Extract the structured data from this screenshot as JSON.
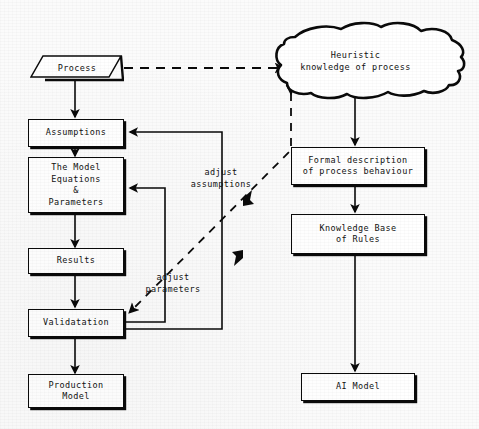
{
  "diagram": {
    "accent_color": "#0a0a0a",
    "background_color": "#fbfbfb",
    "nodes": {
      "process": {
        "label": "Process",
        "shape": "parallelogram"
      },
      "assumptions": {
        "label": "Assumptions",
        "shape": "rectangle"
      },
      "model_equations": {
        "label": "The Model\nEquations\n&\nParameters",
        "shape": "rectangle"
      },
      "results": {
        "label": "Results",
        "shape": "rectangle"
      },
      "validatation": {
        "label": "Validatation",
        "shape": "rectangle"
      },
      "production_model": {
        "label": "Production\nModel",
        "shape": "rectangle"
      },
      "heuristic_knowledge": {
        "label": "Heuristic\nknowledge of process",
        "shape": "cloud"
      },
      "formal_description": {
        "label": "Formal description\nof process behaviour",
        "shape": "rectangle"
      },
      "knowledge_base": {
        "label": "Knowledge Base\nof Rules",
        "shape": "rectangle"
      },
      "ai_model": {
        "label": "AI Model",
        "shape": "rectangle"
      }
    },
    "edge_labels": {
      "adjust_assumptions": "adjust\nassumptions",
      "adjust_parameters": "adjust\nparameters"
    },
    "icons": {
      "arrowhead": "arrowhead-icon",
      "dashed_connector": "dashed-arrow-icon"
    }
  }
}
